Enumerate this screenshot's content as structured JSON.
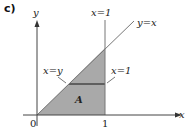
{
  "panel_label": "c)",
  "axes": {
    "x_label": "x",
    "y_label": "y",
    "origin_label": "0",
    "x_tick_label": "1"
  },
  "lines": {
    "vertical_line_label": "x=1",
    "diagonal_line_label": "y=x"
  },
  "region": {
    "label": "A",
    "left_boundary_label": "x=y",
    "right_boundary_label": "x=1",
    "fill_color": "#a9a9a9",
    "strip_color": "#6e6e6e"
  },
  "colors": {
    "axis": "#444444",
    "line": "#777777"
  }
}
